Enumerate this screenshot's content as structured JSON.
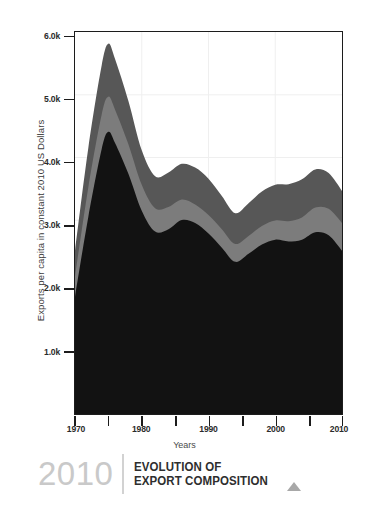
{
  "chart_data": {
    "type": "area",
    "stacked": true,
    "title": "EVOLUTION OF EXPORT COMPOSITION",
    "xlabel": "Years",
    "ylabel": "Exports per capita in constant 2010 US Dollars",
    "xlim": [
      1970,
      2010
    ],
    "ylim": [
      0,
      6200
    ],
    "grid": true,
    "legend": "none",
    "xticks": [
      1970,
      1980,
      1990,
      2000,
      2010
    ],
    "xtick_labels": [
      "1970",
      "1980",
      "1990",
      "2000",
      "2010"
    ],
    "xminor_ticks": [
      1975,
      1985,
      1995,
      2005
    ],
    "yticks": [
      1000,
      2000,
      3000,
      4000,
      5000,
      6000
    ],
    "ytick_labels": [
      "1.0k",
      "2.0k",
      "3.0k",
      "4.0k",
      "5.0k",
      "6.0k"
    ],
    "x": [
      1970,
      1972,
      1974,
      1975,
      1976,
      1978,
      1980,
      1982,
      1984,
      1986,
      1988,
      1990,
      1992,
      1994,
      1996,
      1998,
      2000,
      2002,
      2004,
      2006,
      2008,
      2010
    ],
    "series": [
      {
        "name": "bottom-layer",
        "color": "#121212",
        "values": [
          1900,
          3200,
          4300,
          4580,
          4400,
          3900,
          3300,
          2960,
          3000,
          3150,
          3100,
          2930,
          2700,
          2470,
          2600,
          2750,
          2830,
          2800,
          2830,
          2950,
          2900,
          2650
        ]
      },
      {
        "name": "middle-layer",
        "color": "#7c7c7c",
        "values": [
          330,
          480,
          560,
          570,
          540,
          480,
          420,
          380,
          360,
          330,
          300,
          300,
          300,
          290,
          290,
          300,
          310,
          330,
          360,
          400,
          430,
          450
        ]
      },
      {
        "name": "top-layer",
        "color": "#575757",
        "values": [
          420,
          640,
          800,
          860,
          820,
          700,
          560,
          520,
          560,
          580,
          600,
          590,
          540,
          500,
          530,
          560,
          580,
          600,
          620,
          620,
          580,
          520
        ]
      }
    ],
    "totals": [
      2650,
      4320,
      5660,
      6010,
      5760,
      5080,
      4280,
      3860,
      3920,
      4060,
      4000,
      3820,
      3540,
      3260,
      3420,
      3610,
      3720,
      3730,
      3810,
      3970,
      3910,
      3620
    ]
  },
  "axes": {
    "ylabel": "Exports per capita in constant 2010 US Dollars",
    "xlabel": "Years",
    "ytick_labels": [
      "6.0k",
      "5.0k",
      "4.0k",
      "3.0k",
      "2.0k",
      "1.0k"
    ],
    "xtick_labels": [
      "1970",
      "1980",
      "1990",
      "2000",
      "2010"
    ]
  },
  "footer": {
    "year": "2010",
    "title_line1": "EVOLUTION OF",
    "title_line2": "EXPORT COMPOSITION"
  },
  "colors": {
    "layer_bottom": "#121212",
    "layer_middle": "#7c7c7c",
    "layer_top": "#575757",
    "axis": "#1c1c1c",
    "grid": "#ececec",
    "footer_year": "#c9c9c9",
    "footer_title": "#2e2e2e"
  }
}
